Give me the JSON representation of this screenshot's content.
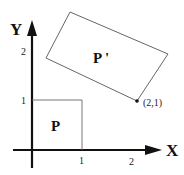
{
  "diagram": {
    "axes": {
      "x_label": "X",
      "y_label": "Y",
      "x_ticks": [
        "1",
        "2"
      ],
      "y_ticks": [
        "1",
        "2"
      ]
    },
    "shapes": {
      "original": {
        "label": "P"
      },
      "transformed": {
        "label": "P '"
      }
    },
    "marked_point": {
      "label": "(2,1)"
    }
  }
}
